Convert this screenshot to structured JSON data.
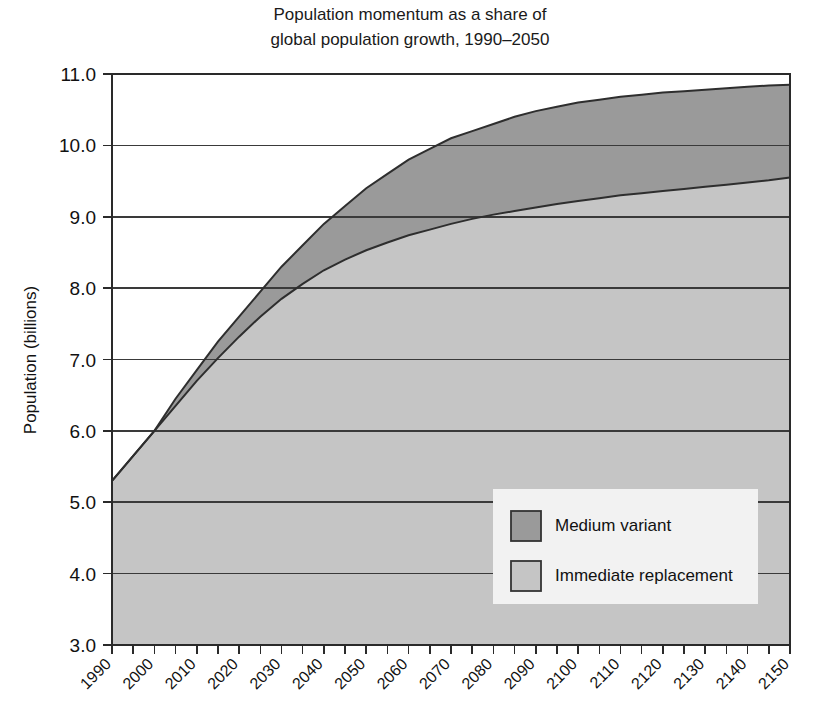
{
  "chart_data": {
    "type": "area",
    "title": "Population momentum as a share of\nglobal population growth, 1990–2050",
    "title_line1": "Population momentum as a share of",
    "title_line2": "global population growth, 1990–2050",
    "xlabel": "",
    "ylabel": "Population (billions)",
    "xlim": [
      1990,
      2150
    ],
    "ylim": [
      3.0,
      11.0
    ],
    "grid": true,
    "legend_position": "inside-bottom-right",
    "y_ticks": [
      "3.0",
      "4.0",
      "5.0",
      "6.0",
      "7.0",
      "8.0",
      "9.0",
      "10.0",
      "11.0"
    ],
    "y_tick_values": [
      3.0,
      4.0,
      5.0,
      6.0,
      7.0,
      8.0,
      9.0,
      10.0,
      11.0
    ],
    "x_ticks": [
      "1990",
      "2000",
      "2010",
      "2020",
      "2030",
      "2040",
      "2050",
      "2060",
      "2070",
      "2080",
      "2090",
      "2100",
      "2110",
      "2120",
      "2130",
      "2140",
      "2150"
    ],
    "x_tick_values": [
      1990,
      2000,
      2010,
      2020,
      2030,
      2040,
      2050,
      2060,
      2070,
      2080,
      2090,
      2100,
      2110,
      2120,
      2130,
      2140,
      2150
    ],
    "x_minor_step": 5,
    "x": [
      1990,
      1995,
      2000,
      2005,
      2010,
      2015,
      2020,
      2025,
      2030,
      2035,
      2040,
      2045,
      2050,
      2055,
      2060,
      2065,
      2070,
      2075,
      2080,
      2085,
      2090,
      2095,
      2100,
      2105,
      2110,
      2115,
      2120,
      2125,
      2130,
      2135,
      2140,
      2145,
      2150
    ],
    "series": [
      {
        "name": "Medium variant",
        "color": "#9a9a9a",
        "values": [
          5.3,
          5.65,
          6.0,
          6.45,
          6.85,
          7.25,
          7.6,
          7.95,
          8.3,
          8.6,
          8.9,
          9.15,
          9.4,
          9.6,
          9.8,
          9.95,
          10.1,
          10.2,
          10.3,
          10.4,
          10.48,
          10.54,
          10.6,
          10.64,
          10.68,
          10.71,
          10.74,
          10.76,
          10.78,
          10.8,
          10.82,
          10.84,
          10.85
        ]
      },
      {
        "name": "Immediate replacement",
        "color": "#c5c5c5",
        "values": [
          5.3,
          5.65,
          6.0,
          6.35,
          6.7,
          7.02,
          7.32,
          7.6,
          7.85,
          8.06,
          8.25,
          8.4,
          8.53,
          8.64,
          8.74,
          8.82,
          8.9,
          8.97,
          9.03,
          9.08,
          9.13,
          9.18,
          9.22,
          9.26,
          9.3,
          9.33,
          9.36,
          9.39,
          9.42,
          9.45,
          9.48,
          9.51,
          9.55
        ]
      }
    ],
    "legend": [
      {
        "label": "Medium variant",
        "color": "#9a9a9a"
      },
      {
        "label": "Immediate replacement",
        "color": "#c5c5c5"
      }
    ]
  },
  "colors": {
    "medium_variant": "#9a9a9a",
    "immediate_replacement": "#c5c5c5",
    "axis": "#2a2a2a",
    "grid": "#3a3a3a",
    "legend_background": "#f2f2f2",
    "page_background": "#ffffff"
  }
}
